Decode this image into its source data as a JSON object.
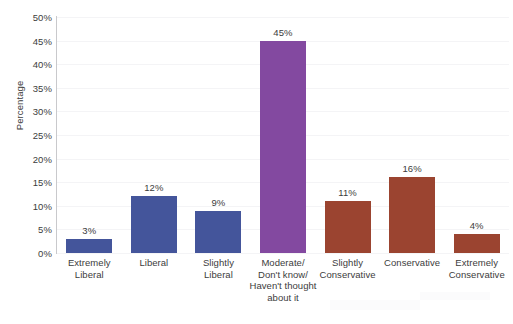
{
  "chart_data": {
    "type": "bar",
    "title": "",
    "cropped_title_sliver": "",
    "xlabel": "",
    "ylabel": "Percentage",
    "ylim": [
      0,
      50
    ],
    "ytick_labels": [
      "50%",
      "45%",
      "40%",
      "35%",
      "30%",
      "25%",
      "20%",
      "15%",
      "10%",
      "5%",
      "0%"
    ],
    "ytick_values": [
      50,
      45,
      40,
      35,
      30,
      25,
      20,
      15,
      10,
      5,
      0
    ],
    "grid": true,
    "legend": "none",
    "categories": [
      "Extremely Liberal",
      "Liberal",
      "Slightly Liberal",
      "Moderate/ Don't know/ Haven't thought about it",
      "Slightly Conservative",
      "Conservative",
      "Extremely Conservative"
    ],
    "category_lines": [
      [
        "Extremely",
        "Liberal"
      ],
      [
        "Liberal"
      ],
      [
        "Slightly",
        "Liberal"
      ],
      [
        "Moderate/",
        "Don't know/",
        "Haven't thought",
        "about it"
      ],
      [
        "Slightly",
        "Conservative"
      ],
      [
        "Conservative"
      ],
      [
        "Extremely",
        "Conservative"
      ]
    ],
    "values": [
      3,
      12,
      9,
      45,
      11,
      16,
      4
    ],
    "value_labels": [
      "3%",
      "12%",
      "9%",
      "45%",
      "11%",
      "16%",
      "4%"
    ],
    "bar_colors": [
      "#44559b",
      "#44559b",
      "#44559b",
      "#8349a0",
      "#9b4430",
      "#9b4430",
      "#9b4430"
    ],
    "colors": {
      "liberal_blue": "#44559b",
      "moderate_purple": "#8349a0",
      "conservative_brown": "#9b4430",
      "axis_line": "#c9c9cc",
      "gridline": "#f4f4f6",
      "text": "#3c3c3c",
      "background": "#ffffff"
    }
  }
}
